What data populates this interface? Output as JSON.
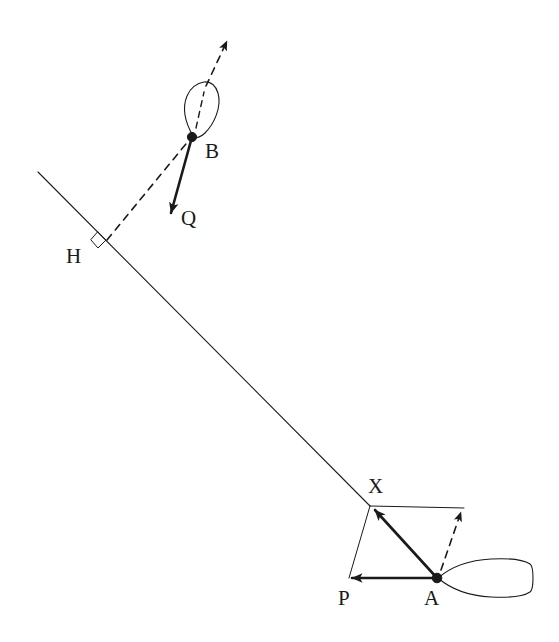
{
  "figure": {
    "background_color": "#ffffff",
    "ink_color": "#1a1a1a",
    "width": 559,
    "height": 642,
    "labels": [
      {
        "id": "B",
        "text": "B",
        "x": 205,
        "y": 158
      },
      {
        "id": "Q",
        "text": "Q",
        "x": 181,
        "y": 225
      },
      {
        "id": "H",
        "text": "H",
        "x": 66,
        "y": 263
      },
      {
        "id": "X",
        "text": "X",
        "x": 368,
        "y": 493
      },
      {
        "id": "P",
        "text": "P",
        "x": 338,
        "y": 605
      },
      {
        "id": "A",
        "text": "A",
        "x": 424,
        "y": 605
      }
    ],
    "points": [
      {
        "id": "B",
        "x": 192,
        "y": 137,
        "marker": "filled-dot"
      },
      {
        "id": "H",
        "x": 106,
        "y": 241,
        "marker": "none"
      },
      {
        "id": "X",
        "x": 370,
        "y": 506,
        "marker": "none"
      },
      {
        "id": "A",
        "x": 437,
        "y": 578,
        "marker": "filled-dot"
      },
      {
        "id": "P",
        "x": 349,
        "y": 578,
        "marker": "none"
      }
    ],
    "segments": [
      {
        "id": "baseline",
        "style": "solid-thin",
        "from": [
          38,
          172
        ],
        "to": [
          370,
          506
        ]
      },
      {
        "id": "perpendicular",
        "style": "dashed",
        "from": [
          106,
          241
        ],
        "to": [
          190,
          139
        ]
      },
      {
        "id": "vector-Q",
        "style": "solid-thick-arrow",
        "from": [
          192,
          137
        ],
        "to": [
          170,
          216
        ]
      },
      {
        "id": "heading-B",
        "style": "dashed-arrow",
        "from": [
          196,
          130
        ],
        "to": [
          228,
          39
        ]
      },
      {
        "id": "vector-X",
        "style": "solid-thick-arrow",
        "from": [
          437,
          578
        ],
        "to": [
          373,
          508
        ]
      },
      {
        "id": "vector-P",
        "style": "solid-thick-arrow",
        "from": [
          437,
          578
        ],
        "to": [
          349,
          578
        ]
      },
      {
        "id": "heading-A",
        "style": "dashed-arrow",
        "from": [
          440,
          572
        ],
        "to": [
          462,
          509
        ]
      },
      {
        "id": "par-top",
        "style": "solid-hair",
        "from": [
          370,
          506
        ],
        "to": [
          464,
          508
        ]
      },
      {
        "id": "par-left",
        "style": "solid-hair",
        "from": [
          370,
          506
        ],
        "to": [
          349,
          578
        ]
      }
    ],
    "right_angle_marker": {
      "id": "right-angle-H",
      "x": 101,
      "y": 238,
      "size": 11
    },
    "boats": [
      {
        "id": "boat-B",
        "description": "leaf-shaped hull at point B, bow pointing up-right"
      },
      {
        "id": "boat-A",
        "description": "lens-shaped hull at point A, bow pointing left"
      }
    ]
  }
}
